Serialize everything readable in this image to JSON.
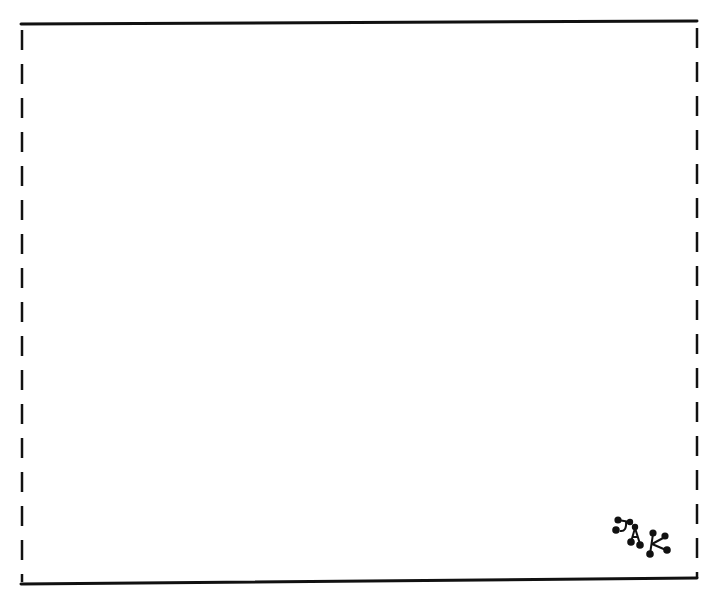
{
  "drawing": {
    "type": "blank-frame-drawing",
    "frame": {
      "top_edge": "solid",
      "bottom_edge": "solid",
      "left_edge": "dashed",
      "right_edge": "dashed",
      "stroke_color": "#111111",
      "background_color": "#ffffff"
    },
    "monogram": {
      "text": "JAK",
      "letters": [
        "J",
        "A",
        "K"
      ],
      "position": "bottom-right"
    }
  }
}
